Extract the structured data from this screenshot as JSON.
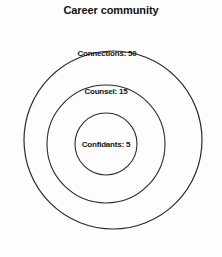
{
  "figure": {
    "title": "Career community",
    "background_color": "#fdfdfd",
    "stroke_color": "#2b2b2b"
  },
  "chart_data": {
    "type": "pie",
    "title": "Career community",
    "subtitle": "",
    "xlabel": "",
    "ylabel": "",
    "layout": "concentric-circles",
    "legend_position": "none",
    "grid": false,
    "categories": [
      "Connections",
      "Counsel",
      "Confidants"
    ],
    "values": [
      50,
      15,
      5
    ],
    "rings": [
      {
        "name": "Connections",
        "value": 50,
        "label": "Connections: 50",
        "center_x": 113,
        "center_y": 140,
        "radius": 89,
        "stroke": "#2b2b2b",
        "stroke_width": 1.2,
        "fill": "none"
      },
      {
        "name": "Counsel",
        "value": 15,
        "label": "Counsel: 15",
        "center_x": 106,
        "center_y": 144,
        "radius": 59,
        "stroke": "#2b2b2b",
        "stroke_width": 1.1,
        "fill": "none"
      },
      {
        "name": "Confidants",
        "value": 5,
        "label": "Confidants: 5",
        "center_x": 106,
        "center_y": 144,
        "radius": 31,
        "stroke": "#2b2b2b",
        "stroke_width": 1.1,
        "fill": "none"
      }
    ]
  }
}
